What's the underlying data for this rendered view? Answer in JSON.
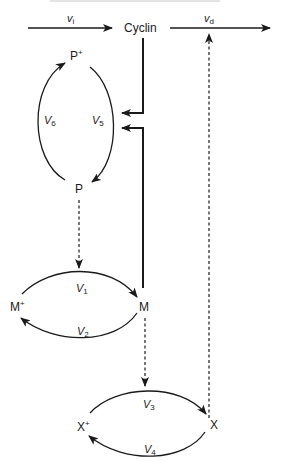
{
  "diagram": {
    "top_caption_partial": "",
    "nodes": {
      "cyclin": "Cyclin",
      "p_plus": "P",
      "p": "P",
      "m_plus": "M",
      "m": "M",
      "x_plus": "X",
      "x": "X",
      "plus_sign": "+"
    },
    "rates": {
      "vi": {
        "base": "v",
        "sub": "i"
      },
      "vd": {
        "base": "v",
        "sub": "d"
      },
      "V1": {
        "base": "V",
        "sub": "1"
      },
      "V2": {
        "base": "V",
        "sub": "2"
      },
      "V3": {
        "base": "V",
        "sub": "3"
      },
      "V4": {
        "base": "V",
        "sub": "4"
      },
      "V5": {
        "base": "V",
        "sub": "5"
      },
      "V6": {
        "base": "V",
        "sub": "6"
      }
    },
    "edges": [
      {
        "from": "source",
        "to": "Cyclin",
        "label": "vi",
        "style": "solid"
      },
      {
        "from": "Cyclin",
        "to": "sink",
        "label": "vd",
        "style": "solid"
      },
      {
        "from": "P+",
        "to": "P",
        "label": "V5",
        "style": "solid"
      },
      {
        "from": "P",
        "to": "P+",
        "label": "V6",
        "style": "solid"
      },
      {
        "from": "M+",
        "to": "M",
        "label": "V1",
        "style": "solid"
      },
      {
        "from": "M",
        "to": "M+",
        "label": "V2",
        "style": "solid"
      },
      {
        "from": "X+",
        "to": "X",
        "label": "V3",
        "style": "solid"
      },
      {
        "from": "X",
        "to": "X+",
        "label": "V4",
        "style": "solid"
      },
      {
        "from": "Cyclin",
        "to": "V5",
        "style": "thick",
        "type": "activation"
      },
      {
        "from": "M",
        "to": "V5",
        "style": "thick",
        "type": "activation"
      },
      {
        "from": "P",
        "to": "V1",
        "style": "dashed",
        "type": "modulation"
      },
      {
        "from": "M",
        "to": "V3",
        "style": "dashed",
        "type": "modulation"
      },
      {
        "from": "X",
        "to": "vd",
        "style": "dashed",
        "type": "modulation"
      }
    ]
  }
}
